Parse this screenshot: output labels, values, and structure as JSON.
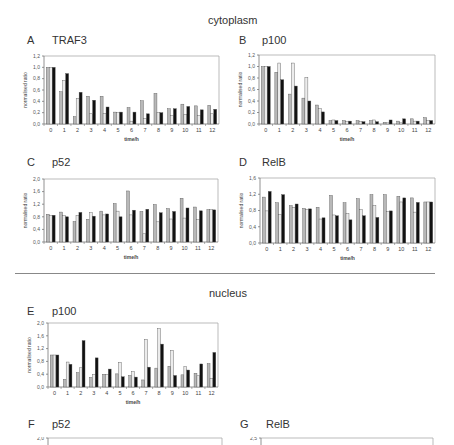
{
  "sections": {
    "cytoplasm": "cytoplasm",
    "nucleus": "nucleus"
  },
  "panels": [
    {
      "letter": "A",
      "name": "TRAF3"
    },
    {
      "letter": "B",
      "name": "p100"
    },
    {
      "letter": "C",
      "name": "p52"
    },
    {
      "letter": "D",
      "name": "RelB"
    },
    {
      "letter": "E",
      "name": "p100"
    },
    {
      "letter": "F",
      "name": "p52"
    },
    {
      "letter": "G",
      "name": "RelB"
    }
  ],
  "colors": {
    "series1": "#b8b8b8",
    "series2": "#ececec",
    "series3": "#111111",
    "axis": "#777777",
    "frame": "#aaaaaa"
  },
  "chart_data": [
    {
      "id": "A",
      "title": "TRAF3",
      "section": "cytoplasm",
      "type": "bar",
      "xlabel": "time/h",
      "ylabel": "normalised ratio",
      "ylim": [
        0,
        1.2
      ],
      "yticks": [
        "0,0",
        "0,2",
        "0,4",
        "0,6",
        "0,8",
        "1,0",
        "1,2"
      ],
      "categories": [
        "0",
        "1",
        "2",
        "3",
        "4",
        "5",
        "6",
        "7",
        "8",
        "9",
        "10",
        "11",
        "12"
      ],
      "series": [
        {
          "name": "series1",
          "values": [
            1.0,
            0.57,
            0.13,
            0.49,
            0.49,
            0.21,
            0.29,
            0.41,
            0.54,
            0.27,
            0.35,
            0.32,
            0.33
          ]
        },
        {
          "name": "series2",
          "values": [
            1.0,
            0.77,
            0.45,
            0.18,
            0.19,
            0.2,
            0.05,
            0.1,
            0.2,
            0.15,
            0.17,
            0.15,
            0.18
          ]
        },
        {
          "name": "series3",
          "values": [
            1.0,
            0.89,
            0.56,
            0.42,
            0.3,
            0.21,
            0.21,
            0.18,
            0.2,
            0.27,
            0.31,
            0.25,
            0.26
          ]
        }
      ],
      "grid": false
    },
    {
      "id": "B",
      "title": "p100",
      "section": "cytoplasm",
      "type": "bar",
      "xlabel": "time/h",
      "ylabel": "normalised ratio",
      "ylim": [
        0,
        1.2
      ],
      "yticks": [
        "0,0",
        "0,2",
        "0,4",
        "0,6",
        "0,8",
        "1,0",
        "1,2"
      ],
      "categories": [
        "0",
        "1",
        "2",
        "3",
        "4",
        "5",
        "6",
        "7",
        "8",
        "9",
        "10",
        "11",
        "12"
      ],
      "series": [
        {
          "name": "series1",
          "values": [
            1.0,
            0.9,
            0.52,
            0.45,
            0.33,
            0.06,
            0.06,
            0.06,
            0.06,
            0.03,
            0.05,
            0.09,
            0.11
          ]
        },
        {
          "name": "series2",
          "values": [
            1.0,
            1.06,
            1.06,
            0.81,
            0.27,
            0.07,
            0.04,
            0.04,
            0.07,
            0.02,
            0.02,
            0.05,
            0.06
          ]
        },
        {
          "name": "series3",
          "values": [
            1.0,
            0.77,
            0.66,
            0.4,
            0.21,
            0.06,
            0.05,
            0.04,
            0.04,
            0.07,
            0.09,
            0.05,
            0.06
          ]
        }
      ],
      "grid": false
    },
    {
      "id": "C",
      "title": "p52",
      "section": "cytoplasm",
      "type": "bar",
      "xlabel": "time/h",
      "ylabel": "normalised ratio",
      "ylim": [
        0,
        2.0
      ],
      "yticks": [
        "0,0",
        "0,4",
        "0,8",
        "1,2",
        "1,6",
        "2,0"
      ],
      "categories": [
        "0",
        "1",
        "2",
        "3",
        "4",
        "5",
        "6",
        "7",
        "8",
        "9",
        "10",
        "11",
        "12"
      ],
      "series": [
        {
          "name": "series1",
          "values": [
            0.88,
            0.95,
            0.65,
            0.72,
            0.98,
            1.22,
            1.62,
            0.97,
            1.19,
            1.06,
            1.39,
            1.11,
            1.03
          ]
        },
        {
          "name": "series2",
          "values": [
            0.84,
            0.84,
            0.84,
            0.93,
            0.86,
            0.98,
            0.86,
            0.26,
            0.64,
            0.73,
            0.76,
            0.71,
            1.03
          ]
        },
        {
          "name": "series3",
          "values": [
            0.85,
            0.8,
            0.94,
            0.82,
            0.89,
            0.8,
            1.01,
            1.04,
            0.93,
            0.97,
            1.08,
            0.99,
            1.02
          ]
        }
      ],
      "grid": false
    },
    {
      "id": "D",
      "title": "RelB",
      "section": "cytoplasm",
      "type": "bar",
      "xlabel": "time/h",
      "ylabel": "normalised ratio",
      "ylim": [
        0,
        1.6
      ],
      "yticks": [
        "0,0",
        "0,4",
        "0,8",
        "1,2",
        "1,6"
      ],
      "categories": [
        "0",
        "1",
        "2",
        "3",
        "4",
        "5",
        "6",
        "7",
        "8",
        "9",
        "10",
        "11",
        "12"
      ],
      "series": [
        {
          "name": "series1",
          "values": [
            1.13,
            0.99,
            0.92,
            0.85,
            0.88,
            1.17,
            0.99,
            1.09,
            1.19,
            1.19,
            1.15,
            1.11,
            1.01
          ]
        },
        {
          "name": "series2",
          "values": [
            0.79,
            0.7,
            0.88,
            0.83,
            0.59,
            0.69,
            0.72,
            0.82,
            0.92,
            0.77,
            1.01,
            0.76,
            1.01
          ]
        },
        {
          "name": "series3",
          "values": [
            1.27,
            1.19,
            0.96,
            0.84,
            0.62,
            0.67,
            0.57,
            0.67,
            0.63,
            0.79,
            1.11,
            1.0,
            1.01
          ]
        }
      ],
      "grid": false
    },
    {
      "id": "E",
      "title": "p100",
      "section": "nucleus",
      "type": "bar",
      "xlabel": "time/h",
      "ylabel": "normalised ratio",
      "ylim": [
        0,
        2.0
      ],
      "yticks": [
        "0,0",
        "0,4",
        "0,8",
        "1,2",
        "1,6",
        "2,0"
      ],
      "categories": [
        "0",
        "1",
        "2",
        "3",
        "4",
        "5",
        "6",
        "7",
        "8",
        "9",
        "10",
        "11",
        "12"
      ],
      "series": [
        {
          "name": "series1",
          "values": [
            1.0,
            0.24,
            0.45,
            0.3,
            0.4,
            0.41,
            0.36,
            0.22,
            0.59,
            0.65,
            0.38,
            0.43,
            0.73
          ]
        },
        {
          "name": "series2",
          "values": [
            1.0,
            0.78,
            0.6,
            0.4,
            0.4,
            0.77,
            0.48,
            1.49,
            1.83,
            1.15,
            0.64,
            0.35,
            0.27
          ]
        },
        {
          "name": "series3",
          "values": [
            1.0,
            0.71,
            1.45,
            0.91,
            0.56,
            0.32,
            0.31,
            0.62,
            1.34,
            0.36,
            0.53,
            0.72,
            1.08
          ]
        }
      ],
      "grid": false
    },
    {
      "id": "F",
      "title": "p52",
      "section": "nucleus",
      "type": "bar",
      "ylim": [
        0,
        2.0
      ],
      "yticks": [
        "2,0"
      ],
      "partial": true
    },
    {
      "id": "G",
      "title": "RelB",
      "section": "nucleus",
      "type": "bar",
      "ylim": [
        0,
        2.5
      ],
      "yticks": [
        "2,5"
      ],
      "partial": true
    }
  ]
}
